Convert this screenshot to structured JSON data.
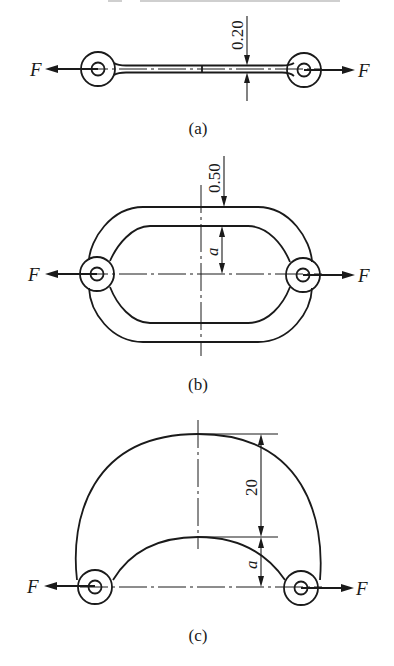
{
  "figure": {
    "header_fragment": "",
    "panels": [
      {
        "id": "a",
        "caption": "(a)",
        "description": "Straight thin link with eyelets at both ends under axial tension",
        "force_left": "F",
        "force_right": "F",
        "dimension_thickness": "0.20"
      },
      {
        "id": "b",
        "caption": "(b)",
        "description": "Oval (chain-link) ring loaded at its two eyelets",
        "force_left": "F",
        "force_right": "F",
        "dimension_thickness": "0.50",
        "dimension_offset": "a"
      },
      {
        "id": "c",
        "caption": "(c)",
        "description": "Crescent-shaped arch member loaded at its two eyelets",
        "force_left": "F",
        "force_right": "F",
        "dimension_height": "20",
        "dimension_offset": "a"
      }
    ]
  }
}
